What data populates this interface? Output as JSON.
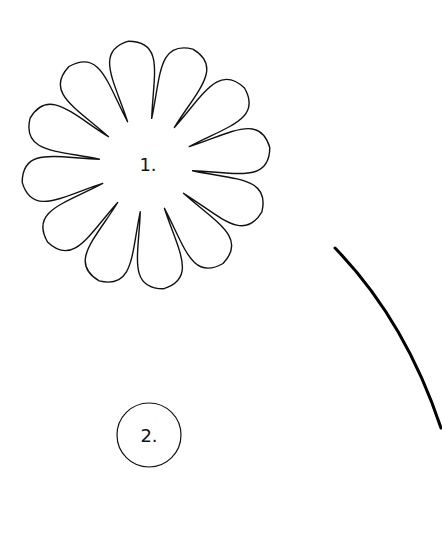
{
  "canvas": {
    "width": 442,
    "height": 534,
    "background": "#ffffff"
  },
  "flower": {
    "label": "1.",
    "petal_count": 12,
    "center": [
      146,
      165
    ],
    "outer_radius": 125,
    "inner_radius": 47,
    "rotation_deg": -83,
    "stroke": "#111111",
    "stroke_width": 1.4
  },
  "circle": {
    "label": "2.",
    "center": [
      149,
      435
    ],
    "radius": 32,
    "stroke": "#111111",
    "stroke_width": 1.2
  },
  "arc": {
    "start": [
      335,
      248
    ],
    "control": [
      405,
      320
    ],
    "end": [
      441,
      428
    ],
    "stroke": "#000000",
    "stroke_width": 3
  }
}
